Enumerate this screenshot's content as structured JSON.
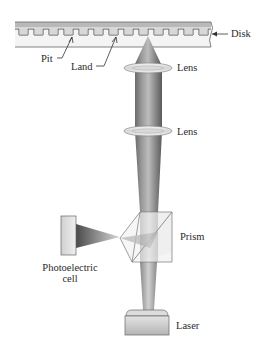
{
  "diagram": {
    "labels": {
      "disk": "Disk",
      "pit": "Pit",
      "land": "Land",
      "lens_upper": "Lens",
      "lens_lower": "Lens",
      "prism": "Prism",
      "photoelectric_cell_line1": "Photoelectric",
      "photoelectric_cell_line2": "cell",
      "laser": "Laser"
    },
    "components": [
      "Disk",
      "Pit",
      "Land",
      "Lens",
      "Lens",
      "Prism",
      "Photoelectric cell",
      "Laser"
    ],
    "colors": {
      "beam_dark": "#5a5a5a",
      "beam_light": "#c8c8c8",
      "disk_fill": "#f2f2f2",
      "disk_stripe": "#b5b5b5",
      "outline": "#555555"
    }
  }
}
